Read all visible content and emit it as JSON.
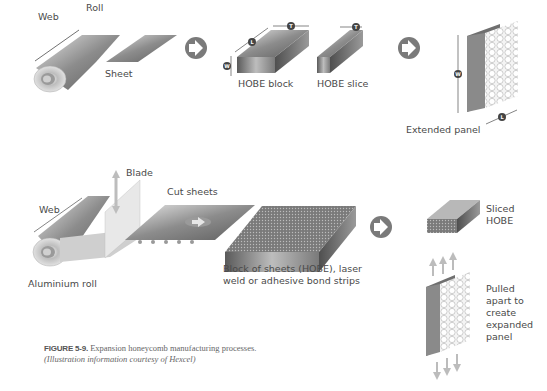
{
  "figure": {
    "number_label": "FIGURE 5-9.",
    "caption": "Expansion honeycomb manufacturing processes.",
    "credit": "(Illustration information courtesy of Hexcel)"
  },
  "top_process": {
    "labels": {
      "web": "Web",
      "roll": "Roll",
      "sheet": "Sheet",
      "hobe_block": "HOBE block",
      "hobe_slice": "HOBE slice",
      "extended_panel": "Extended panel"
    },
    "dimension_markers": {
      "length": "L",
      "thickness": "T",
      "width": "W"
    }
  },
  "bottom_process": {
    "labels": {
      "blade": "Blade",
      "cut_sheets": "Cut sheets",
      "web": "Web",
      "aluminium_roll": "Aluminium roll",
      "block_of_sheets": "Block of sheets (HOBE), laser weld or adhesive bond strips",
      "sliced_hobe": "Sliced HOBE",
      "pulled_apart": "Pulled apart to create expanded panel"
    }
  },
  "colors": {
    "arrow_circle": "#7a7a7a",
    "text": "#4a4a4a",
    "metal_dark": "#6e6e6e",
    "metal_light": "#d8d8d8"
  }
}
